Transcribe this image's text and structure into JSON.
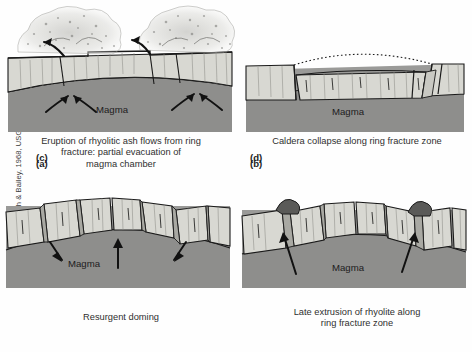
{
  "figure": {
    "credit": "Modified from Smith & Bailey, 1968, USGS",
    "magma_label": "Magma"
  },
  "colors": {
    "background": "#fefefe",
    "crust_light": "#d8d8d2",
    "crust_shade": "#bdbdb6",
    "magma": "#9a9a98",
    "magma_deep": "#8e8e8c",
    "rhyolite": "#5a5a58",
    "outline": "#1a1a1a",
    "text": "#2f2f2f",
    "ash": "#b9b9b5"
  },
  "panels": [
    {
      "id": "a",
      "label": "(a)",
      "caption": "Eruption of rhyolitic ash flows from ring\nfracture: partial evacuation of\nmagma chamber",
      "magma_label": "Magma",
      "features": [
        "ash-cloud",
        "ring-fracture",
        "inward-arrows",
        "magma-chamber"
      ]
    },
    {
      "id": "b",
      "label": "(b)",
      "caption": "Caldera collapse along ring fracture zone",
      "magma_label": "Magma",
      "features": [
        "dotted-former-surface",
        "collapsed-block",
        "ring-fracture",
        "magma-chamber"
      ]
    },
    {
      "id": "c",
      "label": "(c)",
      "caption": "Resurgent doming",
      "magma_label": "Magma",
      "features": [
        "resurgent-dome",
        "uplift-arrow",
        "tilted-blocks",
        "magma-chamber"
      ]
    },
    {
      "id": "d",
      "label": "(d)",
      "caption": "Late extrusion of rhyolite along\nring fracture zone",
      "magma_label": "Magma",
      "features": [
        "rhyolite-domes",
        "feeder-arrows",
        "ring-fracture",
        "magma-chamber"
      ]
    }
  ]
}
